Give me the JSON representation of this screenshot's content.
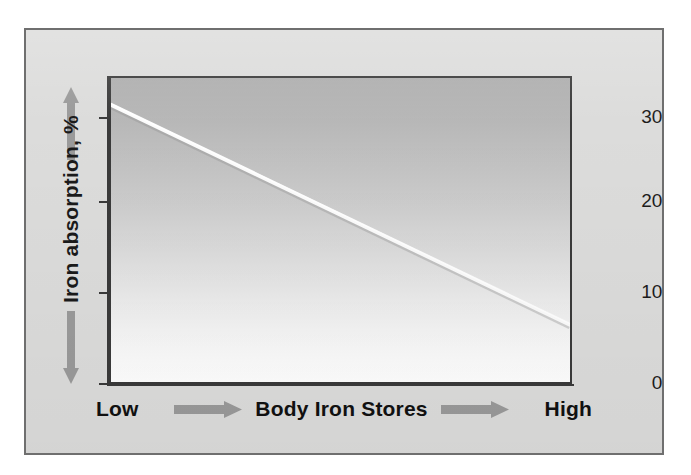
{
  "figure": {
    "frame_border_color": "#6f6f6f",
    "frame_fill_color": "#dcdcdb",
    "panel_border_color": "#3a3a3a",
    "arrow_color": "#9a9a9a",
    "line_color": "#fbfbfb",
    "axis_color": "#3a3a3a",
    "text_color": "#111111"
  },
  "y_axis": {
    "title": "Iron absorption, %",
    "up_arrow_icon": "arrow-up-icon",
    "down_arrow_icon": "arrow-down-icon",
    "ticks": [
      {
        "label": "0",
        "value": 0
      },
      {
        "label": "10",
        "value": 10
      },
      {
        "label": "20",
        "value": 20
      },
      {
        "label": "30",
        "value": 30
      }
    ]
  },
  "x_axis": {
    "title": "Body Iron Stores",
    "low_label": "Low",
    "high_label": "High",
    "left_arrow_icon": "arrow-right-icon",
    "right_arrow_icon": "arrow-right-icon"
  },
  "chart_data": {
    "type": "line",
    "title": "",
    "subtitle": "",
    "xlabel": "Body Iron Stores",
    "ylabel": "Iron absorption, %",
    "xlim": [
      0,
      100
    ],
    "ylim": [
      0,
      34
    ],
    "yticks": [
      0,
      10,
      20,
      30
    ],
    "ytick_labels": [
      "0",
      "10",
      "20",
      "30"
    ],
    "xtick_labels": [
      "Low",
      "High"
    ],
    "grid": false,
    "legend": null,
    "legend_position": "none",
    "annotations": [],
    "background": "vertical gradient, gray at top fading to white at bottom",
    "series": [
      {
        "name": "Iron absorption",
        "color": "#fbfbfb",
        "x": [
          0,
          10,
          20,
          30,
          40,
          50,
          60,
          70,
          80,
          90,
          100
        ],
        "values": [
          31.0,
          28.5,
          26.0,
          23.6,
          21.1,
          18.7,
          16.2,
          13.7,
          11.3,
          8.8,
          6.4
        ]
      }
    ]
  }
}
